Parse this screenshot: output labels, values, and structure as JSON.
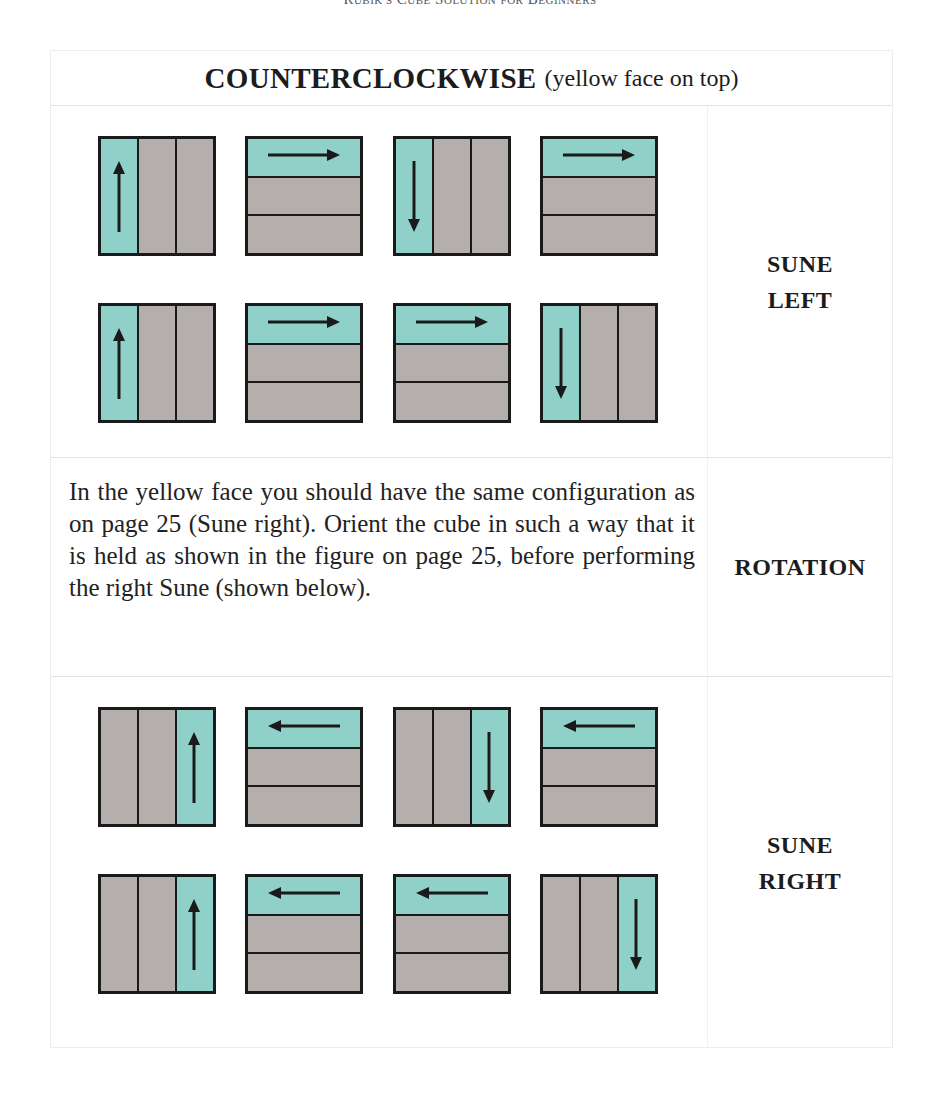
{
  "running_head": "Rubik's Cube Solution for Beginners",
  "title": {
    "main": "COUNTERCLOCKWISE",
    "sub": "(yellow face on top)"
  },
  "colors": {
    "teal": "#8fd1c8",
    "gray": "#b4aeac",
    "border": "#1a1a1a"
  },
  "sections": [
    {
      "id": "sune-left",
      "label_line1": "SUNE",
      "label_line2": "LEFT",
      "moves": [
        {
          "strip": "left",
          "arrow": "up"
        },
        {
          "strip": "top",
          "arrow": "right"
        },
        {
          "strip": "left",
          "arrow": "down"
        },
        {
          "strip": "top",
          "arrow": "right"
        },
        {
          "strip": "left",
          "arrow": "up"
        },
        {
          "strip": "top",
          "arrow": "right"
        },
        {
          "strip": "top",
          "arrow": "right"
        },
        {
          "strip": "left",
          "arrow": "down"
        }
      ]
    },
    {
      "id": "rotation",
      "label_line1": "ROTATION",
      "text": "In the yellow face you should have the same configuration as on page 25 (Sune right). Orient the cube in such a way that it is held as shown in the figure on page 25, before performing the right Sune (shown below)."
    },
    {
      "id": "sune-right",
      "label_line1": "SUNE",
      "label_line2": "RIGHT",
      "moves": [
        {
          "strip": "right",
          "arrow": "up"
        },
        {
          "strip": "top",
          "arrow": "left"
        },
        {
          "strip": "right",
          "arrow": "down"
        },
        {
          "strip": "top",
          "arrow": "left"
        },
        {
          "strip": "right",
          "arrow": "up"
        },
        {
          "strip": "top",
          "arrow": "left"
        },
        {
          "strip": "top",
          "arrow": "left"
        },
        {
          "strip": "right",
          "arrow": "down"
        }
      ]
    }
  ]
}
